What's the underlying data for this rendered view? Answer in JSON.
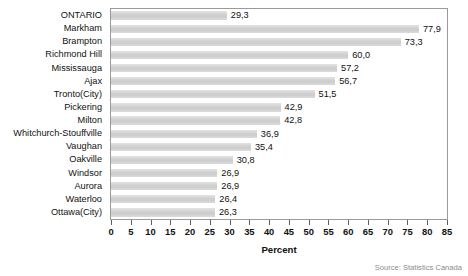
{
  "chart_data": {
    "type": "bar",
    "orientation": "horizontal",
    "title": "",
    "xlabel": "Percent",
    "ylabel": "",
    "xlim": [
      0,
      85
    ],
    "xticks": [
      0,
      5,
      10,
      15,
      20,
      25,
      30,
      35,
      40,
      45,
      50,
      55,
      60,
      65,
      70,
      75,
      80,
      85
    ],
    "xtick_labels": [
      "0",
      "5",
      "10",
      "15",
      "20",
      "25",
      "30",
      "35",
      "40",
      "45",
      "50",
      "55",
      "60",
      "65",
      "70",
      "75",
      "80",
      "85"
    ],
    "grid": false,
    "legend": null,
    "decimal_separator": ",",
    "categories": [
      "ONTARIO",
      "Markham",
      "Brampton",
      "Richmond Hill",
      "Mississauga",
      "Ajax",
      "Tronto(City)",
      "Pickering",
      "Milton",
      "Whitchurch-Stouffville",
      "Vaughan",
      "Oakville",
      "Windsor",
      "Aurora",
      "Waterloo",
      "Ottawa(City)"
    ],
    "values": [
      29.3,
      77.9,
      73.3,
      60.0,
      57.2,
      56.7,
      51.5,
      42.9,
      42.8,
      36.9,
      35.4,
      30.8,
      26.9,
      26.9,
      26.4,
      26.3
    ],
    "value_labels": [
      "29,3",
      "77,9",
      "73,3",
      "60,0",
      "57,2",
      "56,7",
      "51,5",
      "42,9",
      "42,8",
      "36,9",
      "35,4",
      "30,8",
      "26,9",
      "26,9",
      "26,4",
      "26,3"
    ],
    "annotations": [
      {
        "text": "Source: Statistics Canada",
        "position": "bottom-right-inside-plot"
      }
    ],
    "colors": {
      "bar_fill": "#d2d2d2",
      "bar_fill_light": "#e4e4e4",
      "frame": "#9a9a9a",
      "text": "#111111",
      "annotation_text": "#8c8c8c",
      "background": "#ffffff"
    }
  },
  "axis": {
    "title": "Percent"
  },
  "source": {
    "text": "Source: Statistics Canada"
  }
}
